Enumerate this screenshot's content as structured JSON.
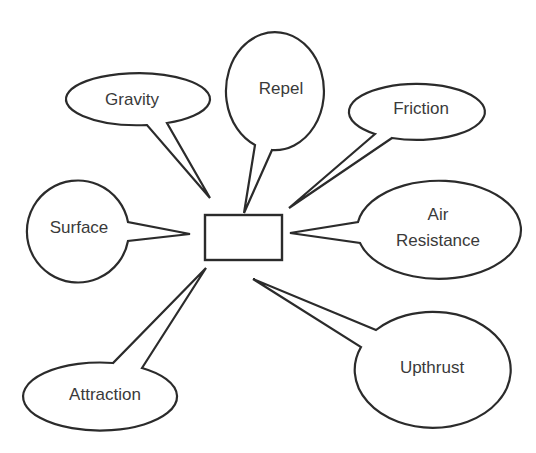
{
  "diagram": {
    "type": "spider-diagram",
    "center": {
      "label": "",
      "shape": "rectangle"
    },
    "colors": {
      "stroke": "#2b2b2b",
      "text": "#3a3a3a",
      "background": "#ffffff"
    },
    "bubbles": [
      {
        "id": "gravity",
        "label": "Gravity",
        "lines": [
          "Gravity"
        ]
      },
      {
        "id": "repel",
        "label": "Repel",
        "lines": [
          "Repel"
        ]
      },
      {
        "id": "friction",
        "label": "Friction",
        "lines": [
          "Friction"
        ]
      },
      {
        "id": "surface",
        "label": "Surface",
        "lines": [
          "Surface"
        ]
      },
      {
        "id": "air-resistance",
        "label": "Air Resistance",
        "lines": [
          "Air",
          "Resistance"
        ]
      },
      {
        "id": "attraction",
        "label": "Attraction",
        "lines": [
          "Attraction"
        ]
      },
      {
        "id": "upthrust",
        "label": "Upthrust",
        "lines": [
          "Upthrust"
        ]
      }
    ]
  }
}
